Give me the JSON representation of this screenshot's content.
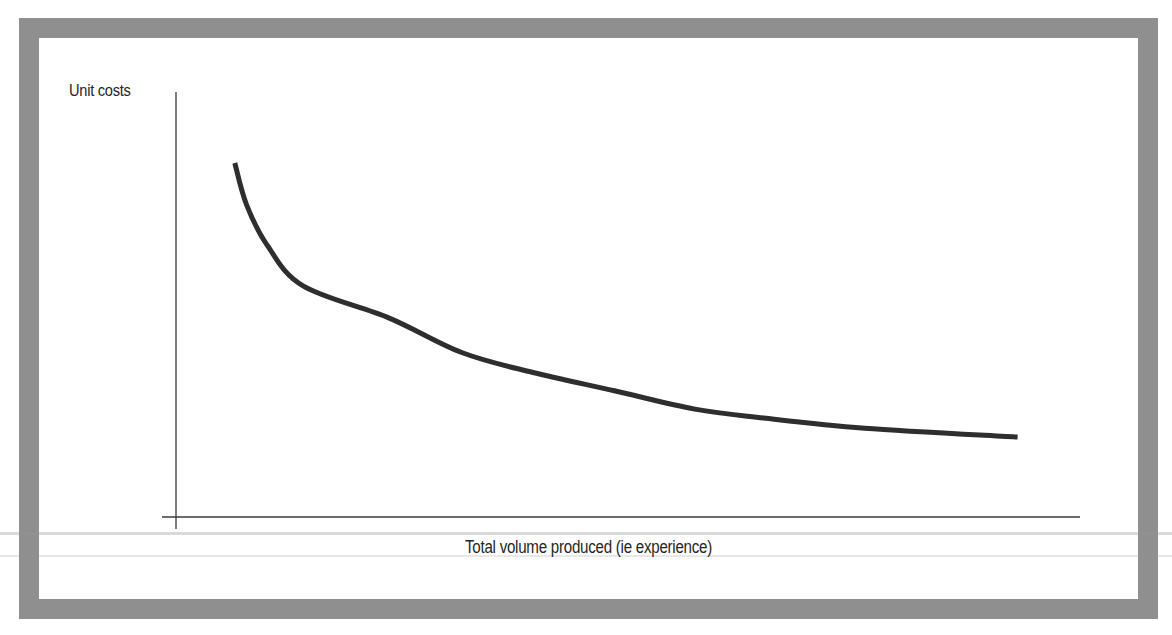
{
  "figure": {
    "frame_color": "#8f8f8f",
    "line_color": "#2e2e2e",
    "axis_color": "#3a3a3a"
  },
  "chart_data": {
    "type": "line",
    "title": "",
    "xlabel": "Total volume produced (ie experience)",
    "ylabel": "Unit costs",
    "grid": false,
    "legend": null,
    "x_ticks": [],
    "y_ticks": [],
    "xlim": [
      0,
      100
    ],
    "ylim": [
      0,
      100
    ],
    "note": "Conceptual experience curve; no numeric ticks shown. Values are normalized positions estimated from the drawing (0 = axis origin, 100 = axis end).",
    "series": [
      {
        "name": "Unit costs",
        "x": [
          6.5,
          7.8,
          10.1,
          14.1,
          23.6,
          31.6,
          39.5,
          48.5,
          57.4,
          65.0,
          76.2,
          93.1
        ],
        "y": [
          83.3,
          73.5,
          63.9,
          54.3,
          46.8,
          38.7,
          34.0,
          29.7,
          25.4,
          23.3,
          20.9,
          18.8
        ]
      }
    ]
  }
}
